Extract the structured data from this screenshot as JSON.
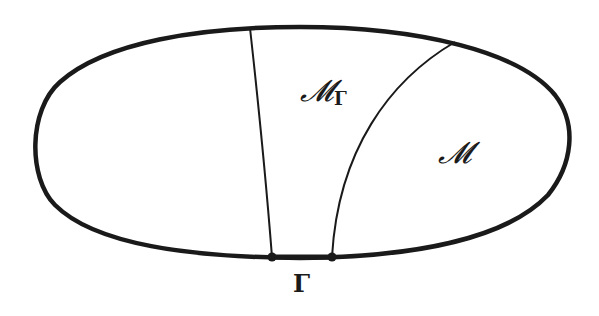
{
  "figure": {
    "colors": {
      "stroke": "#1a1a1a",
      "background": "#ffffff"
    },
    "labels": {
      "region_boundary": {
        "main": "𝓜",
        "sub": "Γ"
      },
      "region_main": "𝓜",
      "boundary_segment": "Γ"
    },
    "elements": {
      "outer_boundary": "closed-oval-curve",
      "left_divider": "near-vertical-line",
      "right_divider": "curved-arc",
      "boundary_points": 2
    }
  }
}
